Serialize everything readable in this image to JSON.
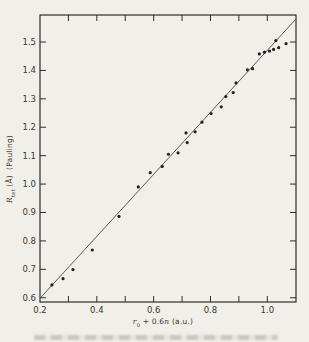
{
  "colors": {
    "background": "#f1efea",
    "ink": "#2f2d29",
    "tick_label": "#3a372f",
    "fit_line": "#4c4a46",
    "point": "#232220"
  },
  "chart_data": {
    "type": "scatter",
    "title": "",
    "xlabel": "r₀ + 0.6n (a.u.)",
    "ylabel": "R_tet (Å) (Pauling)",
    "xlabel_parts": {
      "var": "r",
      "sub": "0",
      "mid": " + 0.6",
      "var2": "n",
      "unit": " (a.u.)"
    },
    "ylabel_parts": {
      "var": "R",
      "sub": "tet",
      "mid": " (Å)",
      "unit": " (Pauling)"
    },
    "x_axis": {
      "range": [
        0.2,
        1.101
      ],
      "labeled_ticks": [
        0.2,
        0.4,
        0.6,
        0.8,
        1.0
      ],
      "tick_labels": [
        "0.2",
        "0.4",
        "0.6",
        "0.8",
        "1.0"
      ],
      "minor_tick_values": [
        0.3,
        0.4,
        0.5,
        0.6,
        0.7,
        0.8,
        0.9,
        1.0
      ]
    },
    "y_axis": {
      "range": [
        0.585,
        1.595
      ],
      "labeled_ticks": [
        0.6,
        0.7,
        0.8,
        0.9,
        1.0,
        1.1,
        1.2,
        1.3,
        1.4,
        1.5
      ],
      "tick_labels": [
        "0.6",
        "0.7",
        "0.8",
        "0.9",
        "1.0",
        "1.1",
        "1.2",
        "1.3",
        "1.4",
        "1.5"
      ]
    },
    "grid": false,
    "legend": null,
    "fit_line": {
      "x1": 0.202,
      "y1": 0.6,
      "x2": 1.101,
      "y2": 1.581
    },
    "points": [
      [
        0.242,
        0.645
      ],
      [
        0.281,
        0.667
      ],
      [
        0.316,
        0.699
      ],
      [
        0.384,
        0.768
      ],
      [
        0.478,
        0.886
      ],
      [
        0.546,
        0.99
      ],
      [
        0.588,
        1.04
      ],
      [
        0.63,
        1.062
      ],
      [
        0.652,
        1.105
      ],
      [
        0.686,
        1.11
      ],
      [
        0.718,
        1.146
      ],
      [
        0.714,
        1.18
      ],
      [
        0.746,
        1.184
      ],
      [
        0.77,
        1.218
      ],
      [
        0.802,
        1.248
      ],
      [
        0.838,
        1.272
      ],
      [
        0.854,
        1.308
      ],
      [
        0.88,
        1.322
      ],
      [
        0.89,
        1.356
      ],
      [
        0.93,
        1.402
      ],
      [
        0.948,
        1.406
      ],
      [
        0.972,
        1.458
      ],
      [
        0.99,
        1.464
      ],
      [
        1.008,
        1.468
      ],
      [
        1.022,
        1.474
      ],
      [
        1.04,
        1.48
      ],
      [
        1.03,
        1.505
      ],
      [
        1.066,
        1.494
      ]
    ]
  }
}
